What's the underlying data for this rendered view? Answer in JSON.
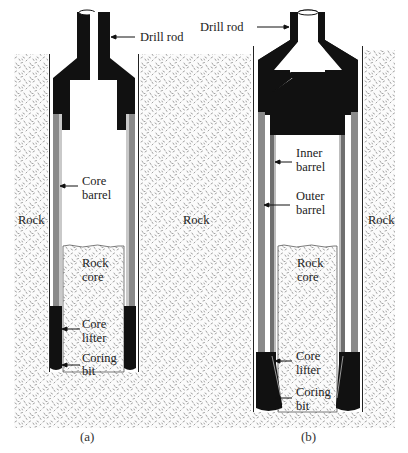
{
  "figure": {
    "panels": [
      {
        "id": "a",
        "caption": "(a)",
        "labels": {
          "drill_rod": "Drill rod",
          "rock_left": "Rock",
          "core_barrel_line1": "Core",
          "core_barrel_line2": "barrel",
          "rock_core_line1": "Rock",
          "rock_core_line2": "core",
          "core_lifter_line1": "Core",
          "core_lifter_line2": "lifter",
          "coring_bit_line1": "Coring",
          "coring_bit_line2": "bit"
        }
      },
      {
        "id": "b",
        "caption": "(b)",
        "labels": {
          "drill_rod": "Drill rod",
          "rock_middle": "Rock",
          "rock_right": "Rock",
          "inner_barrel_line1": "Inner",
          "inner_barrel_line2": "barrel",
          "outer_barrel_line1": "Outer",
          "outer_barrel_line2": "barrel",
          "rock_core_line1": "Rock",
          "rock_core_line2": "core",
          "core_lifter_line1": "Core",
          "core_lifter_line2": "lifter",
          "coring_bit_line1": "Coring",
          "coring_bit_line2": "bit"
        }
      }
    ],
    "colors": {
      "steel_black": "#111111",
      "barrel_gray": "#8a8a8a",
      "rock_speckle": "#8c8c8c",
      "background": "#ffffff"
    }
  }
}
